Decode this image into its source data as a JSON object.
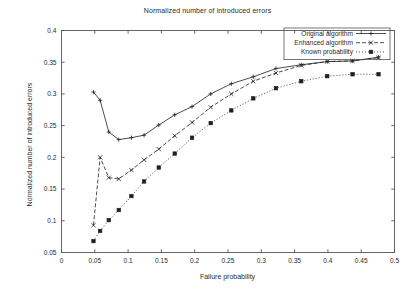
{
  "chart_data": {
    "type": "line",
    "title": "Normalized number of introduced errors",
    "xlabel": "Failure probability",
    "ylabel": "Normalized number of introduced errors",
    "xlim": [
      0,
      0.5
    ],
    "ylim": [
      0.05,
      0.4
    ],
    "xticks": [
      "0",
      "0.05",
      "0.1",
      "0.15",
      "0.2",
      "0.25",
      "0.3",
      "0.35",
      "0.4",
      "0.45",
      "0.5"
    ],
    "yticks": [
      "0.05",
      "0.1",
      "0.15",
      "0.2",
      "0.25",
      "0.3",
      "0.35",
      "0.4"
    ],
    "grid": false,
    "legend_position": "top-right",
    "series": [
      {
        "name": "Original algorithm",
        "marker": "plus",
        "linestyle": "solid",
        "points": [
          [
            0.048,
            0.303
          ],
          [
            0.058,
            0.29
          ],
          [
            0.071,
            0.24
          ],
          [
            0.086,
            0.228
          ],
          [
            0.105,
            0.231
          ],
          [
            0.124,
            0.235
          ],
          [
            0.146,
            0.251
          ],
          [
            0.17,
            0.267
          ],
          [
            0.196,
            0.28
          ],
          [
            0.224,
            0.3
          ],
          [
            0.255,
            0.316
          ],
          [
            0.288,
            0.327
          ],
          [
            0.322,
            0.34
          ],
          [
            0.36,
            0.346
          ],
          [
            0.399,
            0.351
          ],
          [
            0.437,
            0.352
          ],
          [
            0.476,
            0.358
          ]
        ]
      },
      {
        "name": "Enhanced algorithm",
        "marker": "cross",
        "linestyle": "dashed",
        "points": [
          [
            0.048,
            0.093
          ],
          [
            0.058,
            0.2
          ],
          [
            0.071,
            0.168
          ],
          [
            0.086,
            0.166
          ],
          [
            0.105,
            0.18
          ],
          [
            0.124,
            0.196
          ],
          [
            0.146,
            0.213
          ],
          [
            0.17,
            0.234
          ],
          [
            0.196,
            0.255
          ],
          [
            0.224,
            0.279
          ],
          [
            0.255,
            0.3
          ],
          [
            0.288,
            0.32
          ],
          [
            0.322,
            0.333
          ],
          [
            0.36,
            0.345
          ],
          [
            0.399,
            0.351
          ],
          [
            0.437,
            0.352
          ],
          [
            0.476,
            0.357
          ]
        ]
      },
      {
        "name": "Known probability",
        "marker": "filled-square",
        "linestyle": "dotted",
        "points": [
          [
            0.048,
            0.068
          ],
          [
            0.058,
            0.084
          ],
          [
            0.071,
            0.101
          ],
          [
            0.086,
            0.117
          ],
          [
            0.105,
            0.139
          ],
          [
            0.124,
            0.162
          ],
          [
            0.146,
            0.184
          ],
          [
            0.17,
            0.206
          ],
          [
            0.196,
            0.231
          ],
          [
            0.224,
            0.254
          ],
          [
            0.255,
            0.274
          ],
          [
            0.288,
            0.293
          ],
          [
            0.322,
            0.309
          ],
          [
            0.36,
            0.32
          ],
          [
            0.399,
            0.328
          ],
          [
            0.437,
            0.331
          ],
          [
            0.476,
            0.331
          ]
        ]
      }
    ]
  }
}
